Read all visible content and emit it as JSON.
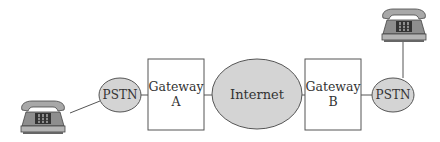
{
  "diagram": {
    "type": "network-topology",
    "colors": {
      "stroke": "#555555",
      "ellipse_fill": "#d4d4d4",
      "box_fill": "#ffffff",
      "text": "#333333",
      "phone_body": "#9a9a9a",
      "phone_dark": "#555555"
    },
    "nodes": [
      {
        "id": "phone-left",
        "kind": "telephone",
        "icon": "telephone-icon"
      },
      {
        "id": "pstn-a",
        "kind": "ellipse",
        "label": "PSTN"
      },
      {
        "id": "gateway-a",
        "kind": "box",
        "label_line1": "Gateway",
        "label_line2": "A"
      },
      {
        "id": "internet",
        "kind": "ellipse",
        "label": "Internet"
      },
      {
        "id": "gateway-b",
        "kind": "box",
        "label_line1": "Gateway",
        "label_line2": "B"
      },
      {
        "id": "pstn-b",
        "kind": "ellipse",
        "label": "PSTN"
      },
      {
        "id": "phone-right",
        "kind": "telephone",
        "icon": "telephone-icon"
      }
    ],
    "edges": [
      {
        "from": "phone-left",
        "to": "pstn-a"
      },
      {
        "from": "pstn-a",
        "to": "gateway-a"
      },
      {
        "from": "gateway-a",
        "to": "internet"
      },
      {
        "from": "internet",
        "to": "gateway-b"
      },
      {
        "from": "gateway-b",
        "to": "pstn-b"
      },
      {
        "from": "pstn-b",
        "to": "phone-right"
      }
    ]
  }
}
